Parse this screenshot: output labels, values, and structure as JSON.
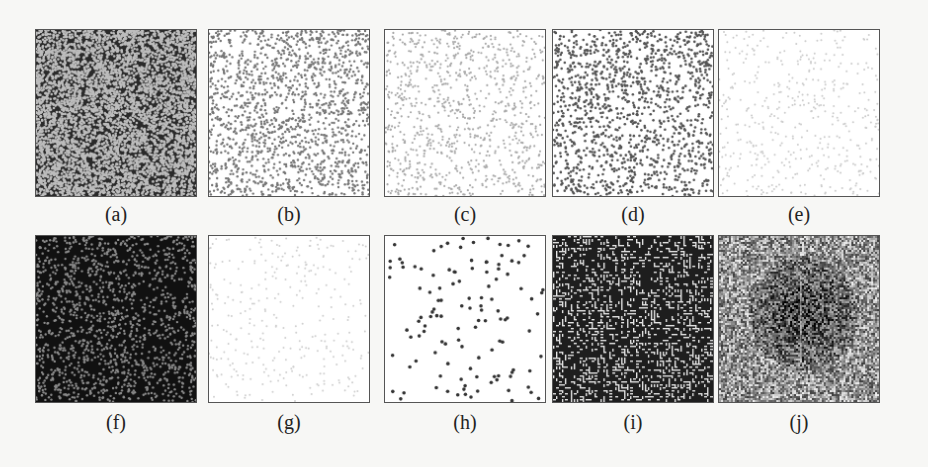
{
  "figure": {
    "panels": [
      {
        "id": "a",
        "label": "(a)",
        "col": 0,
        "row": 0,
        "style": "dense-light-dots-on-dark",
        "bg": "#2a2a2a",
        "dot": "#bdbdbd",
        "count": 5200,
        "size": 1.3
      },
      {
        "id": "b",
        "label": "(b)",
        "col": 1,
        "row": 0,
        "style": "sparse-dark-dots-on-white",
        "bg": "#ffffff",
        "dot": "#777777",
        "count": 1500,
        "size": 1.2
      },
      {
        "id": "c",
        "label": "(c)",
        "col": 2,
        "row": 0,
        "style": "very-sparse-light-dots",
        "bg": "#ffffff",
        "dot": "#aaaaaa",
        "count": 900,
        "size": 1.1
      },
      {
        "id": "d",
        "label": "(d)",
        "col": 3,
        "row": 0,
        "style": "medium-dark-dots-on-white",
        "bg": "#ffffff",
        "dot": "#555555",
        "count": 1300,
        "size": 1.3
      },
      {
        "id": "e",
        "label": "(e)",
        "col": 4,
        "row": 0,
        "style": "faint-dots-on-white",
        "bg": "#ffffff",
        "dot": "#cccccc",
        "count": 450,
        "size": 1.0
      },
      {
        "id": "f",
        "label": "(f)",
        "col": 0,
        "row": 1,
        "style": "sparse-light-dots-on-black",
        "bg": "#111111",
        "dot": "#8a8a8a",
        "count": 1400,
        "size": 1.2
      },
      {
        "id": "g",
        "label": "(g)",
        "col": 1,
        "row": 1,
        "style": "extremely-faint-dots",
        "bg": "#ffffff",
        "dot": "#d0d0d0",
        "count": 300,
        "size": 1.0
      },
      {
        "id": "h",
        "label": "(h)",
        "col": 2,
        "row": 1,
        "style": "few-isolated-dark-dots",
        "bg": "#ffffff",
        "dot": "#333333",
        "count": 120,
        "size": 1.8
      },
      {
        "id": "i",
        "label": "(i)",
        "col": 3,
        "row": 1,
        "style": "labyrinth-pattern",
        "bg": "#1e1e1e",
        "dot": "#e6e6e6",
        "count": 0,
        "size": 0
      },
      {
        "id": "j",
        "label": "(j)",
        "col": 4,
        "row": 1,
        "style": "noise-with-dark-center-blob",
        "bg": "#888888",
        "dot": "#eeeeee",
        "count": 0,
        "size": 0
      }
    ]
  }
}
